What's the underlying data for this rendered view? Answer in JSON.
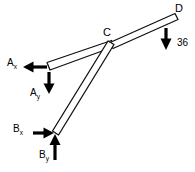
{
  "figure": {
    "type": "free-body-diagram",
    "background_color": "#ffffff",
    "line_color": "#111111",
    "arrow_color": "#000000"
  },
  "joints": {
    "C": {
      "label": "C",
      "x": 112,
      "y": 45
    },
    "D": {
      "label": "D",
      "x": 176,
      "y": 17
    },
    "A": {
      "label": "A",
      "x": 48,
      "y": 67
    },
    "B": {
      "label": "B",
      "x": 56,
      "y": 133
    }
  },
  "members": [
    {
      "name": "member-AC",
      "from": "A",
      "to": "C"
    },
    {
      "name": "member-CD",
      "from": "C",
      "to": "D"
    },
    {
      "name": "member-BC",
      "from": "B",
      "to": "C"
    }
  ],
  "forces": [
    {
      "name": "reaction-Ax",
      "base": "A",
      "label": "A",
      "subscript": "x",
      "direction": "left",
      "magnitude": ""
    },
    {
      "name": "reaction-Ay",
      "base": "A",
      "label": "A",
      "subscript": "y",
      "direction": "down",
      "magnitude": ""
    },
    {
      "name": "reaction-Bx",
      "base": "B",
      "label": "B",
      "subscript": "x",
      "direction": "right",
      "magnitude": ""
    },
    {
      "name": "reaction-By",
      "base": "B",
      "label": "B",
      "subscript": "y",
      "direction": "up",
      "magnitude": ""
    },
    {
      "name": "applied-load-D",
      "base": "D",
      "label": "",
      "subscript": "",
      "direction": "down",
      "magnitude": "36"
    }
  ],
  "labels": {
    "joint_c": "C",
    "joint_d": "D",
    "force_a_base": "A",
    "force_a_x_sub": "x",
    "force_a_y_sub": "y",
    "force_b_base": "B",
    "force_b_x_sub": "x",
    "force_b_y_sub": "y",
    "load_magnitude": "36"
  }
}
